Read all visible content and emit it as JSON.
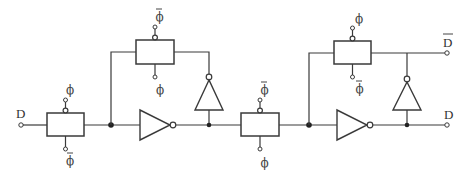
{
  "diagram": {
    "title": "",
    "type": "dynamic-latch-shift-register-stage",
    "input": {
      "label": "D"
    },
    "outputs": [
      {
        "label": "D",
        "overbar": true,
        "name": "D-bar"
      },
      {
        "label": "D",
        "overbar": false,
        "name": "D"
      }
    ],
    "clock_labels": {
      "phi": "ϕ",
      "phi_bar": "ϕ"
    },
    "stages": [
      {
        "name": "stage-1",
        "input_gate": {
          "top_clock": "phi",
          "bottom_clock": "phi_bar"
        },
        "feedback_gate": {
          "top_clock": "phi_bar",
          "bottom_clock": "phi"
        },
        "components": [
          "transmission-gate",
          "inverter-forward",
          "inverter-feedback",
          "transmission-gate-feedback"
        ]
      },
      {
        "name": "stage-2",
        "input_gate": {
          "top_clock": "phi_bar",
          "bottom_clock": "phi"
        },
        "feedback_gate": {
          "top_clock": "phi",
          "bottom_clock": "phi_bar"
        },
        "components": [
          "transmission-gate",
          "inverter-forward",
          "inverter-feedback",
          "transmission-gate-feedback"
        ]
      }
    ]
  }
}
